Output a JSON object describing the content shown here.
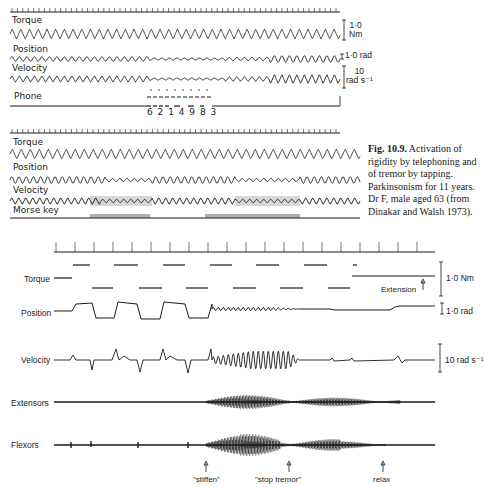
{
  "figure": {
    "caption_label": "Fig. 10.9.",
    "caption_text": " Activation of rigidity by telephoning and of tremor by tapping. Parkinsonism for 11 years. Dr F, male aged 63 (from Dinakar and Walsh 1973)."
  },
  "panel_top": {
    "traces": [
      "Torque",
      "Position",
      "Velocity",
      "Phone"
    ],
    "phone_digits": "6 2 1 4 9  8 3",
    "scales": {
      "torque_value": "1·0",
      "torque_unit": "Nm",
      "position": "1·0 rad",
      "velocity_value": "10",
      "velocity_unit": "rad s⁻¹"
    }
  },
  "panel_middle": {
    "traces": [
      "Torque",
      "Position",
      "Velocity",
      "Morse key"
    ]
  },
  "panel_bottom": {
    "traces": [
      "Torque",
      "Position",
      "Velocity",
      "Extensors",
      "Flexors"
    ],
    "scales": {
      "torque": "1·0 Nm",
      "position": "1·0 rad",
      "velocity": "10 rad s⁻¹"
    },
    "torque_annotation": "Extension",
    "events": [
      {
        "label": "\"stiffen\""
      },
      {
        "label": "\"stop tremor\""
      },
      {
        "label": "relax"
      }
    ]
  },
  "colors": {
    "trace": "#1a1a1a",
    "background": "#ffffff"
  }
}
